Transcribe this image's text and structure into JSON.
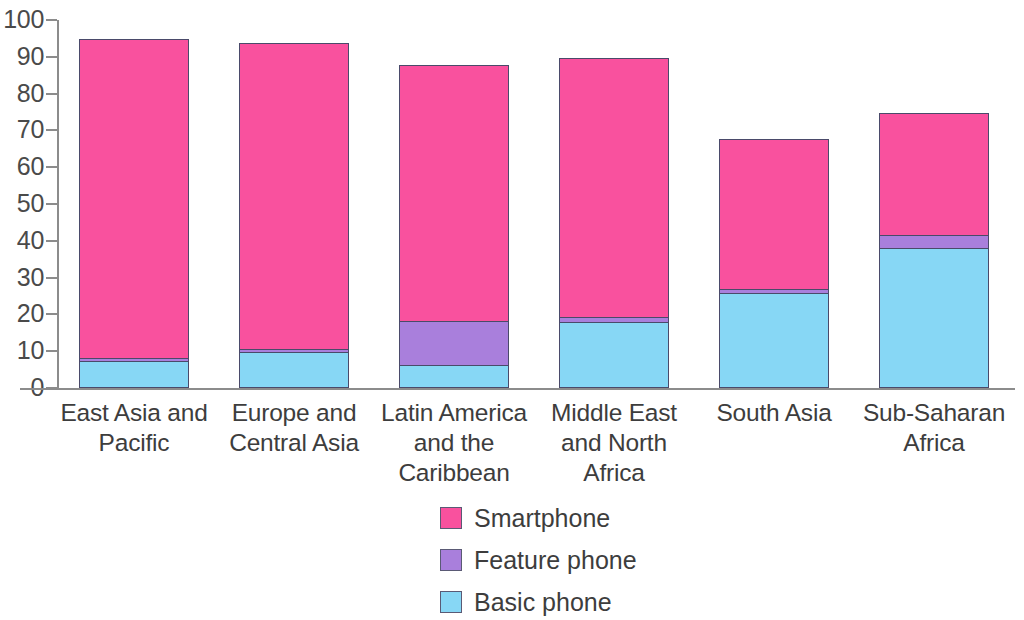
{
  "chart_data": {
    "type": "bar",
    "subtype": "stacked-bar",
    "title": "",
    "xlabel": "",
    "ylabel": "",
    "ylim": [
      0,
      100
    ],
    "y_ticks": [
      0,
      10,
      20,
      30,
      40,
      50,
      60,
      70,
      80,
      90,
      100
    ],
    "grid": false,
    "legend_position": "bottom-center",
    "categories": [
      "East Asia and Pacific",
      "Europe and Central Asia",
      "Latin America and the Caribbean",
      "Middle East and North Africa",
      "South Asia",
      "Sub-Saharan Africa"
    ],
    "series": [
      {
        "name": "Basic phone",
        "color": "#87d7f5",
        "values": [
          7.1,
          9.5,
          6.0,
          17.7,
          25.5,
          37.8
        ]
      },
      {
        "name": "Feature phone",
        "color": "#a97fdc",
        "values": [
          0.9,
          0.9,
          11.9,
          1.4,
          1.1,
          3.5
        ]
      },
      {
        "name": "Smartphone",
        "color": "#f9519e",
        "values": [
          86.6,
          83.0,
          69.6,
          70.3,
          40.8,
          33.2
        ]
      }
    ],
    "totals": [
      94.6,
      93.4,
      87.5,
      89.4,
      67.4,
      74.5
    ],
    "stack_order_bottom_to_top": [
      "Basic phone",
      "Feature phone",
      "Smartphone"
    ]
  },
  "axis": {
    "y_tick_labels": [
      "100",
      "90",
      "80",
      "70",
      "60",
      "50",
      "40",
      "30",
      "20",
      "10",
      "0"
    ]
  },
  "x_axis_labels": [
    {
      "lines": [
        "East Asia and",
        "Pacific"
      ]
    },
    {
      "lines": [
        "Europe and",
        "Central Asia"
      ]
    },
    {
      "lines": [
        "Latin America",
        "and the",
        "Caribbean"
      ]
    },
    {
      "lines": [
        "Middle East",
        "and North",
        "Africa"
      ]
    },
    {
      "lines": [
        "South Asia"
      ]
    },
    {
      "lines": [
        "Sub-Saharan",
        "Africa"
      ]
    }
  ],
  "legend": {
    "items": [
      {
        "label": "Smartphone",
        "color": "#f9519e"
      },
      {
        "label": "Feature phone",
        "color": "#a97fdc"
      },
      {
        "label": "Basic phone",
        "color": "#87d7f5"
      }
    ]
  }
}
